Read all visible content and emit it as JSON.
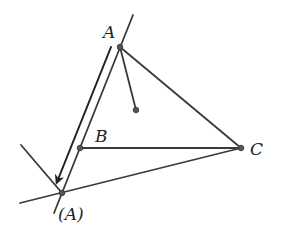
{
  "diagram": {
    "type": "geometry",
    "labels": {
      "A": "A",
      "B": "B",
      "C": "C",
      "A_prime": "(A)"
    },
    "colors": {
      "stroke": "#3a3a3a",
      "point": "#555555",
      "background": "#ffffff"
    }
  }
}
